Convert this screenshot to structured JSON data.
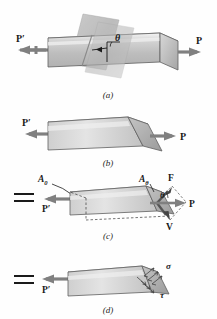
{
  "figure": {
    "background_color": "#fefefe",
    "ink_color": "#1a1a1a",
    "body_fill_light": "#e3e3e3",
    "body_fill_mid": "#c9c9c9",
    "body_fill_dark": "#a8a8a8",
    "plane_fill": "#b9b9b9"
  },
  "panels": [
    {
      "id": "a",
      "caption": "(a)",
      "labels": {
        "load_left": "P′",
        "load_right": "P",
        "angle": "θ"
      }
    },
    {
      "id": "b",
      "caption": "(b)",
      "labels": {
        "load_left": "P′",
        "load_right": "P"
      }
    },
    {
      "id": "c",
      "caption": "(c)",
      "equals_sign": "=",
      "labels": {
        "area_axial": "A",
        "area_axial_sub": "0",
        "area_oblique": "A",
        "area_oblique_sub": "θ",
        "normal_force": "F",
        "shear_force": "V",
        "resultant": "P",
        "load_left": "P′",
        "angle": "θ"
      }
    },
    {
      "id": "d",
      "caption": "(d)",
      "equals_sign": "=",
      "labels": {
        "normal_stress": "σ",
        "shear_stress": "τ",
        "load_left": "P′"
      }
    }
  ]
}
